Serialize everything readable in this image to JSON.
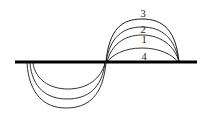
{
  "figure": {
    "type": "line-diagram",
    "background_color": "#ffffff",
    "stroke_color": "#1a1a1a",
    "baseline_color": "#000000",
    "width": 205,
    "height": 117
  },
  "axis": {
    "name": "horizontal-baseline",
    "y": 62,
    "x_start": 15,
    "x_end": 197,
    "thickness": 3.1
  },
  "labels": [
    {
      "id": "label-3",
      "text": "3",
      "x": 143,
      "y": 14
    },
    {
      "id": "label-2",
      "text": "2",
      "x": 143,
      "y": 30
    },
    {
      "id": "label-1",
      "text": "1",
      "x": 144,
      "y": 40
    },
    {
      "id": "label-4",
      "text": "4",
      "x": 144,
      "y": 57
    }
  ],
  "curves": {
    "upper": [
      {
        "id": "upper-arc-3",
        "label": "3",
        "apex_y": 19,
        "x_left": 106,
        "x_right": 179,
        "path": "M 106 62 C 109 29, 122 19, 142 19 C 163 19, 176 30, 179 62"
      },
      {
        "id": "upper-arc-2",
        "label": "2",
        "apex_y": 27,
        "x_left": 106,
        "x_right": 179,
        "path": "M 106 62 C 110 37, 123 27, 142 27 C 162 27, 175 38, 179 62"
      },
      {
        "id": "upper-arc-1",
        "label": "1",
        "apex_y": 35,
        "x_left": 107,
        "x_right": 179,
        "path": "M 107 62 C 111 45, 124 35, 142 35 C 161 35, 175 46, 179 62"
      },
      {
        "id": "upper-arc-4",
        "label": "4",
        "apex_y": 48,
        "x_left": 107,
        "x_right": 178,
        "path": "M 107 62 C 112 55, 124 48, 142 48 C 160 48, 173 55, 178 62"
      }
    ],
    "lower": [
      {
        "id": "lower-arc-outer",
        "apex_y": 108,
        "x_left": 27,
        "x_right": 106,
        "path": "M 27 63 C 29 95, 45 108, 66 108 C 89 108, 103 95, 106 63"
      },
      {
        "id": "lower-arc-middle",
        "apex_y": 99,
        "x_left": 30,
        "x_right": 105,
        "path": "M 30 63 C 32 88, 47 99, 67 99 C 88 99, 102 88, 105 63"
      },
      {
        "id": "lower-arc-inner",
        "apex_y": 89,
        "x_left": 33,
        "x_right": 105,
        "path": "M 33 63 C 35 79, 49 89, 68 89 C 87 89, 101 79, 105 63"
      }
    ]
  }
}
